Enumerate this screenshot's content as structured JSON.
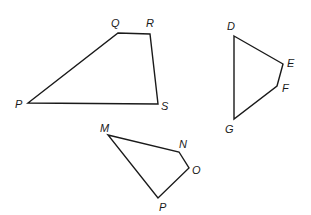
{
  "diagram": {
    "type": "geometric-polygons",
    "shapes": [
      {
        "id": "PQRS",
        "kind": "quadrilateral",
        "vertices": [
          {
            "name": "P",
            "x": 28,
            "y": 103,
            "lx": 15,
            "ly": 108
          },
          {
            "name": "Q",
            "x": 118,
            "y": 33,
            "lx": 111,
            "ly": 27
          },
          {
            "name": "R",
            "x": 150,
            "y": 34,
            "lx": 146,
            "ly": 27
          },
          {
            "name": "S",
            "x": 158,
            "y": 104,
            "lx": 161,
            "ly": 110
          }
        ]
      },
      {
        "id": "DEFG",
        "kind": "quadrilateral",
        "vertices": [
          {
            "name": "D",
            "x": 234,
            "y": 36,
            "lx": 227,
            "ly": 30
          },
          {
            "name": "E",
            "x": 283,
            "y": 64,
            "lx": 287,
            "ly": 67
          },
          {
            "name": "F",
            "x": 277,
            "y": 86,
            "lx": 282,
            "ly": 92
          },
          {
            "name": "G",
            "x": 234,
            "y": 119,
            "lx": 225,
            "ly": 133
          }
        ]
      },
      {
        "id": "MNOP",
        "kind": "quadrilateral",
        "vertices": [
          {
            "name": "M",
            "x": 108,
            "y": 135,
            "lx": 100,
            "ly": 132
          },
          {
            "name": "N",
            "x": 179,
            "y": 152,
            "lx": 179,
            "ly": 148
          },
          {
            "name": "O",
            "x": 189,
            "y": 168,
            "lx": 192,
            "ly": 174
          },
          {
            "name": "P",
            "x": 158,
            "y": 198,
            "lx": 159,
            "ly": 211
          }
        ]
      }
    ]
  }
}
